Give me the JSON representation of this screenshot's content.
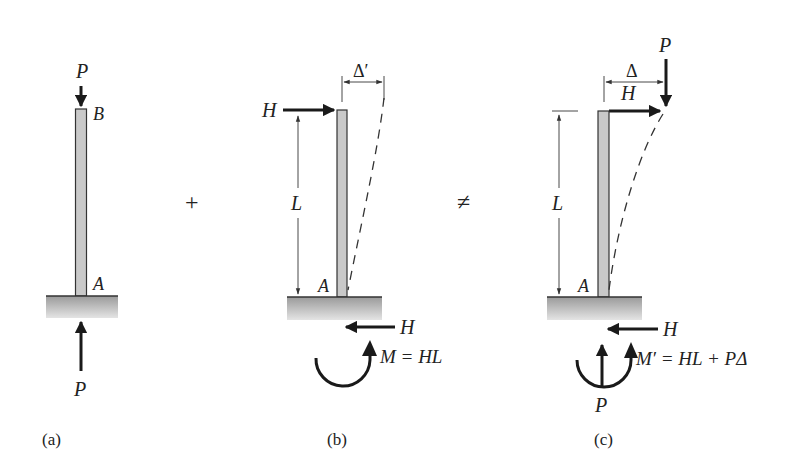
{
  "figure": {
    "operators": {
      "plus": "+",
      "not_equal": "≠"
    },
    "panels": [
      {
        "id": "a",
        "caption": "(a)",
        "labels": {
          "top_load": "P",
          "top_node": "B",
          "base_node": "A",
          "reaction": "P"
        }
      },
      {
        "id": "b",
        "caption": "(b)",
        "labels": {
          "lateral_load": "H",
          "length": "L",
          "deflection": "Δ′",
          "base_node": "A",
          "reaction_shear": "H",
          "reaction_moment": "M = HL"
        }
      },
      {
        "id": "c",
        "caption": "(c)",
        "labels": {
          "axial_load": "P",
          "lateral_load": "H",
          "length": "L",
          "deflection": "Δ",
          "base_node": "A",
          "reaction_shear": "H",
          "reaction_axial": "P",
          "reaction_moment": "M′ = HL + PΔ"
        }
      }
    ]
  }
}
